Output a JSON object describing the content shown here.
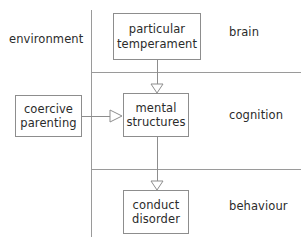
{
  "diagram": {
    "canvas": {
      "width": 302,
      "height": 242,
      "background": "#ffffff"
    },
    "colors": {
      "stroke": "#8d8d8d",
      "text": "#2b2b2b",
      "arrow_fill": "#ffffff",
      "divider": "#9a9a9a"
    },
    "zone_labels": {
      "environment": "environment",
      "brain": "brain",
      "cognition": "cognition",
      "behaviour": "behaviour"
    },
    "nodes": [
      {
        "id": "particular_temperament",
        "label": "particular\ntemperament"
      },
      {
        "id": "coercive_parenting",
        "label": "coercive\nparenting"
      },
      {
        "id": "mental_structures",
        "label": "mental\nstructures"
      },
      {
        "id": "conduct_disorder",
        "label": "conduct\ndisorder"
      }
    ],
    "edges": [
      {
        "from": "particular_temperament",
        "to": "mental_structures",
        "direction": "down",
        "arrowhead": "hollow-triangle"
      },
      {
        "from": "coercive_parenting",
        "to": "mental_structures",
        "direction": "right",
        "arrowhead": "hollow-triangle"
      },
      {
        "from": "mental_structures",
        "to": "conduct_disorder",
        "direction": "down",
        "arrowhead": "hollow-triangle"
      }
    ],
    "dividers": {
      "vertical": {
        "x": 91,
        "y1": 10,
        "y2": 237
      },
      "horizontal": [
        {
          "y": 72,
          "x1": 91,
          "x2": 301
        },
        {
          "y": 169,
          "x1": 91,
          "x2": 301
        }
      ]
    }
  }
}
